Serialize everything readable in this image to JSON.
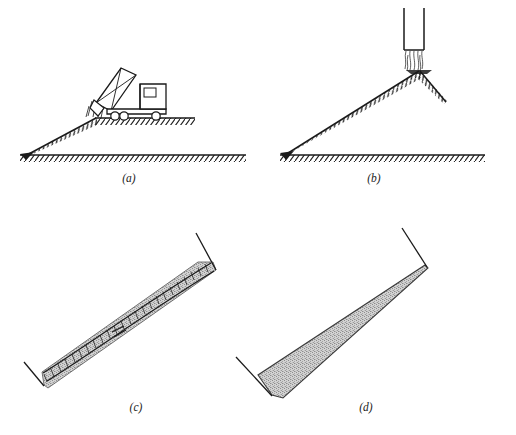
{
  "figure": {
    "background_color": "#ffffff",
    "line_color": "#1a1a1a",
    "fill_color": "#b8b8b8",
    "panel_count": 4
  },
  "panels": [
    {
      "id": "a",
      "label": "(a)",
      "caption_position": "bottom-center",
      "description": "Dump truck discharging fill over the crest of an embankment slope from upper ground onto lower ground",
      "elements": [
        {
          "name": "dump-truck",
          "detail": "tilted dump body with X bracing, cab and four wheels"
        },
        {
          "name": "discharged-material",
          "detail": "granular material falling from raised tailgate"
        },
        {
          "name": "upper-ground-line",
          "detail": "hatched ground surface at truck level"
        },
        {
          "name": "embankment-slope",
          "detail": "hatched descending slope face"
        },
        {
          "name": "lower-ground-line",
          "detail": "hatched ground surface at base level"
        }
      ]
    },
    {
      "id": "b",
      "label": "(b)",
      "caption_position": "bottom-center",
      "description": "Vertical chute discharging granular material onto the apex of a conical stockpile with slopes at the angle of repose",
      "elements": [
        {
          "name": "vertical-chute",
          "detail": "open-ended vertical chute or hopper spout"
        },
        {
          "name": "falling-material-stream",
          "detail": "wavy lines depicting free-falling granular stream"
        },
        {
          "name": "stockpile-peak",
          "detail": "apex of cone formed below the chute"
        },
        {
          "name": "left-slope",
          "detail": "long hatched slope descending to ground"
        },
        {
          "name": "right-slope",
          "detail": "short hatched slope descending to the right"
        },
        {
          "name": "ground-line",
          "detail": "hatched ground surface at base level"
        }
      ]
    },
    {
      "id": "c",
      "label": "(c)",
      "caption_position": "bottom-center",
      "description": "Inclined thin layer of fill shown with ladder-hatched upper surface and stippled granular section between end walls",
      "elements": [
        {
          "name": "inclined-fill-layer",
          "detail": "stippled granular band of near-uniform thickness"
        },
        {
          "name": "ladder-hatched-surface",
          "detail": "rungs marking the compacted upper boundary"
        },
        {
          "name": "lower-end-wall",
          "detail": "V shaped retaining line at the low end"
        },
        {
          "name": "upper-end-wall",
          "detail": "V shaped retaining line at the high end"
        }
      ]
    },
    {
      "id": "d",
      "label": "(d)",
      "caption_position": "bottom-center",
      "description": "Inclined wedge of fill, thickest at the low end and tapering to a feather edge at the high end between end walls",
      "elements": [
        {
          "name": "wedge-fill",
          "detail": "stippled granular wedge tapering upslope"
        },
        {
          "name": "lower-end-wall",
          "detail": "V shaped retaining line at the thick low end"
        },
        {
          "name": "upper-end-wall",
          "detail": "V shaped retaining line at the tapered high end"
        }
      ]
    }
  ]
}
